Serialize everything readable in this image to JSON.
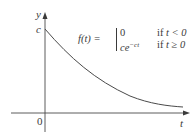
{
  "diagram": {
    "type": "function-graph",
    "axes": {
      "x_label": "t",
      "y_label": "y",
      "origin_label": "0",
      "y_intercept_label": "c"
    },
    "formula": {
      "lhs": "f(t) =",
      "cases": [
        {
          "value": "0",
          "condition_word": "if",
          "condition": "t < 0"
        },
        {
          "value": "ce",
          "value_exponent": "−ct",
          "condition_word": "if",
          "condition": "t ≥ 0"
        }
      ]
    },
    "curve": "exponential decay starting at (0, c), approaching t-axis"
  },
  "colors": {
    "stroke": "#4a4a4a",
    "text": "#3a3a3a",
    "background": "#ffffff"
  }
}
